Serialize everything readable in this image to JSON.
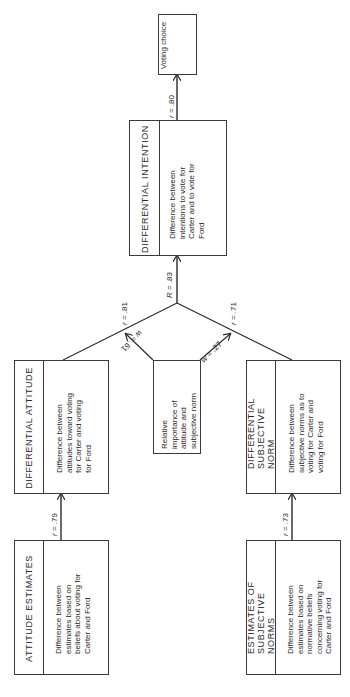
{
  "diagram": {
    "nodes": {
      "voting_choice": {
        "label": "Voting choice"
      },
      "differential_intention": {
        "title": "DIFFERENTIAL INTENTION",
        "description": "Difference between intentions to vote for Carter and to vote for Ford"
      },
      "relative_importance": {
        "label": "Relative importance of attitude and subjective norm"
      },
      "differential_attitude": {
        "title": "DIFFERENTIAL ATTITUDE",
        "description": "Difference between attitudes toward voting for Carter and voting for Ford"
      },
      "differential_subjective_norm": {
        "title": "DIFFERENTIAL SUBJECTIVE NORM",
        "description": "Difference between subjective norms as to voting for Carter and voting for Ford"
      },
      "attitude_estimates": {
        "title": "ATTITUDE ESTIMATES",
        "description": "Difference between estimates based on beliefs about voting for Carter and Ford"
      },
      "estimates_of_subjective_norms": {
        "title": "ESTIMATES OF SUBJECTIVE NORMS",
        "description": "Difference between estimates based on normative beliefs concerning voting for Carter and Ford"
      }
    },
    "edges": {
      "intention_to_choice": {
        "symbol": "r",
        "value": " = .80"
      },
      "combined_to_intention": {
        "symbol": "R",
        "value": " = .83"
      },
      "attitude_to_combined": {
        "symbol": "r",
        "value": " = .81"
      },
      "norm_to_combined": {
        "symbol": "r",
        "value": " = .71"
      },
      "weight_attitude": {
        "symbol": "w",
        "value": " = .61"
      },
      "weight_norm": {
        "symbol": "w",
        "value": " = .27"
      },
      "estimates_to_attitude": {
        "symbol": "r",
        "value": " = .79"
      },
      "estimates_to_norm": {
        "symbol": "r",
        "value": " = .73"
      }
    }
  }
}
